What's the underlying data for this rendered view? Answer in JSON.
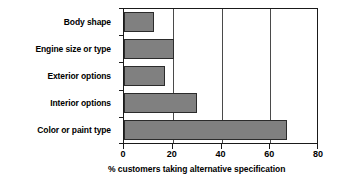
{
  "chart_data": {
    "type": "bar",
    "orientation": "horizontal",
    "title": "",
    "categories": [
      "Body shape",
      "Engine size or type",
      "Exterior options",
      "Interior options",
      "Color or paint type"
    ],
    "values": [
      12.5,
      20.5,
      17,
      30,
      67
    ],
    "xlabel": "% customers taking alternative specification",
    "ylabel": "",
    "xlim": [
      0,
      80
    ],
    "xticks": [
      0,
      20,
      40,
      60,
      80
    ],
    "xtick_labels": [
      "0",
      "20",
      "40",
      "60",
      "80"
    ],
    "grid": true,
    "grid_axis": "x",
    "legend": false,
    "bar_color": "#808080",
    "bar_edge_color": "#2b2b2b",
    "axis_color": "#1a1a1a",
    "background_color": "#ffffff"
  }
}
